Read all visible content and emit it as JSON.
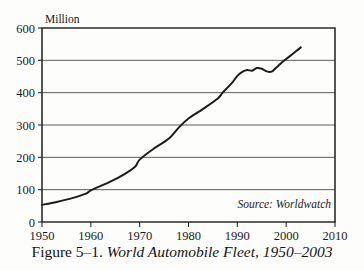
{
  "figure": {
    "caption_prefix": "Figure 5–1.",
    "caption_title": "World Automobile Fleet, 1950–2003",
    "source_note": "Source: Worldwatch",
    "unit_label": "Million"
  },
  "chart_data": {
    "type": "line",
    "title": "World Automobile Fleet, 1950–2003",
    "xlabel": "",
    "ylabel": "Million",
    "xlim": [
      1950,
      2010
    ],
    "ylim": [
      0,
      600
    ],
    "grid": true,
    "legend": "none",
    "x_ticks": [
      1950,
      1960,
      1970,
      1980,
      1990,
      2000,
      2010
    ],
    "y_ticks": [
      0,
      100,
      200,
      300,
      400,
      500,
      600
    ],
    "series": [
      {
        "name": "World automobile fleet",
        "color": "#1c1c1c",
        "x": [
          1950,
          1953,
          1956,
          1959,
          1960,
          1963,
          1966,
          1969,
          1970,
          1973,
          1976,
          1978,
          1980,
          1983,
          1986,
          1987,
          1989,
          1990,
          1991,
          1992,
          1993,
          1994,
          1995,
          1996,
          1997,
          1998,
          1999,
          2000,
          2001,
          2002,
          2003
        ],
        "values": [
          53,
          62,
          73,
          88,
          98,
          118,
          140,
          170,
          193,
          228,
          258,
          292,
          320,
          350,
          382,
          400,
          432,
          452,
          464,
          470,
          468,
          476,
          474,
          466,
          465,
          478,
          492,
          504,
          516,
          528,
          540
        ]
      }
    ]
  }
}
